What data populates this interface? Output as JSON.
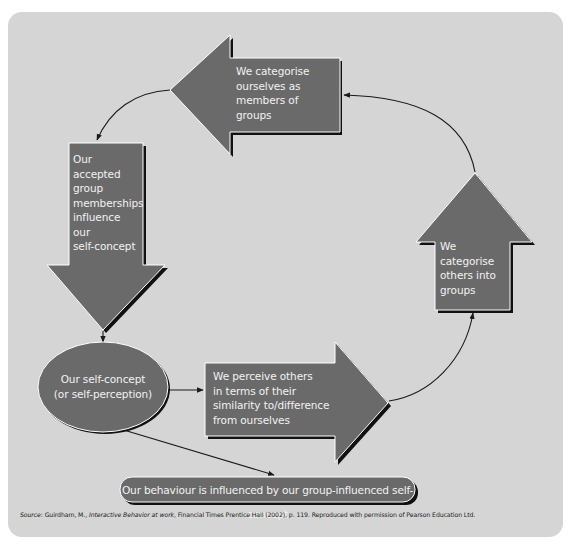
{
  "diagram": {
    "colors": {
      "background_panel": "#d5d5d5",
      "shape_fill": "#6a6a6a",
      "shape_shadow": "#111111",
      "shape_highlight": "#ffffff",
      "shape_text": "#f2f2f2",
      "connector": "#1a1a1a"
    },
    "nodes": {
      "categorise_ourselves": {
        "shape": "arrow-left",
        "lines": [
          "We categorise",
          "ourselves as",
          "members of",
          "groups"
        ]
      },
      "accepted_memberships": {
        "shape": "arrow-down",
        "lines": [
          "Our",
          "accepted",
          "group",
          "memberships",
          "influence",
          "our",
          "self-concept"
        ]
      },
      "self_concept": {
        "shape": "ellipse",
        "lines": [
          "Our self-concept",
          "(or self-perception)"
        ]
      },
      "perceive_others": {
        "shape": "arrow-right",
        "lines": [
          "We perceive others",
          "in terms of their",
          "similarity to/difference",
          "from ourselves"
        ]
      },
      "categorise_others": {
        "shape": "arrow-up",
        "lines": [
          "We",
          "categorise",
          "others into",
          "groups"
        ]
      },
      "behaviour": {
        "shape": "rounded-pill",
        "text": "Our behaviour is influenced by our group-influenced self-concept"
      }
    },
    "edges": [
      {
        "from": "categorise_ourselves",
        "to": "accepted_memberships",
        "style": "curved-arrow"
      },
      {
        "from": "accepted_memberships",
        "to": "self_concept",
        "style": "straight-arrow"
      },
      {
        "from": "self_concept",
        "to": "perceive_others",
        "style": "straight-arrow"
      },
      {
        "from": "self_concept",
        "to": "behaviour",
        "style": "straight-arrow"
      },
      {
        "from": "perceive_others",
        "to": "categorise_others",
        "style": "curved-arrow"
      },
      {
        "from": "categorise_others",
        "to": "categorise_ourselves",
        "style": "curved-arrow"
      }
    ],
    "source": {
      "prefix": "Source",
      "author": ": Guirdham, M., ",
      "title": "Interactive Behavior at work",
      "rest": ", Financial Times Prentice Hall (2002), p. 119. Reproduced with permission of Pearson Education Ltd."
    }
  }
}
